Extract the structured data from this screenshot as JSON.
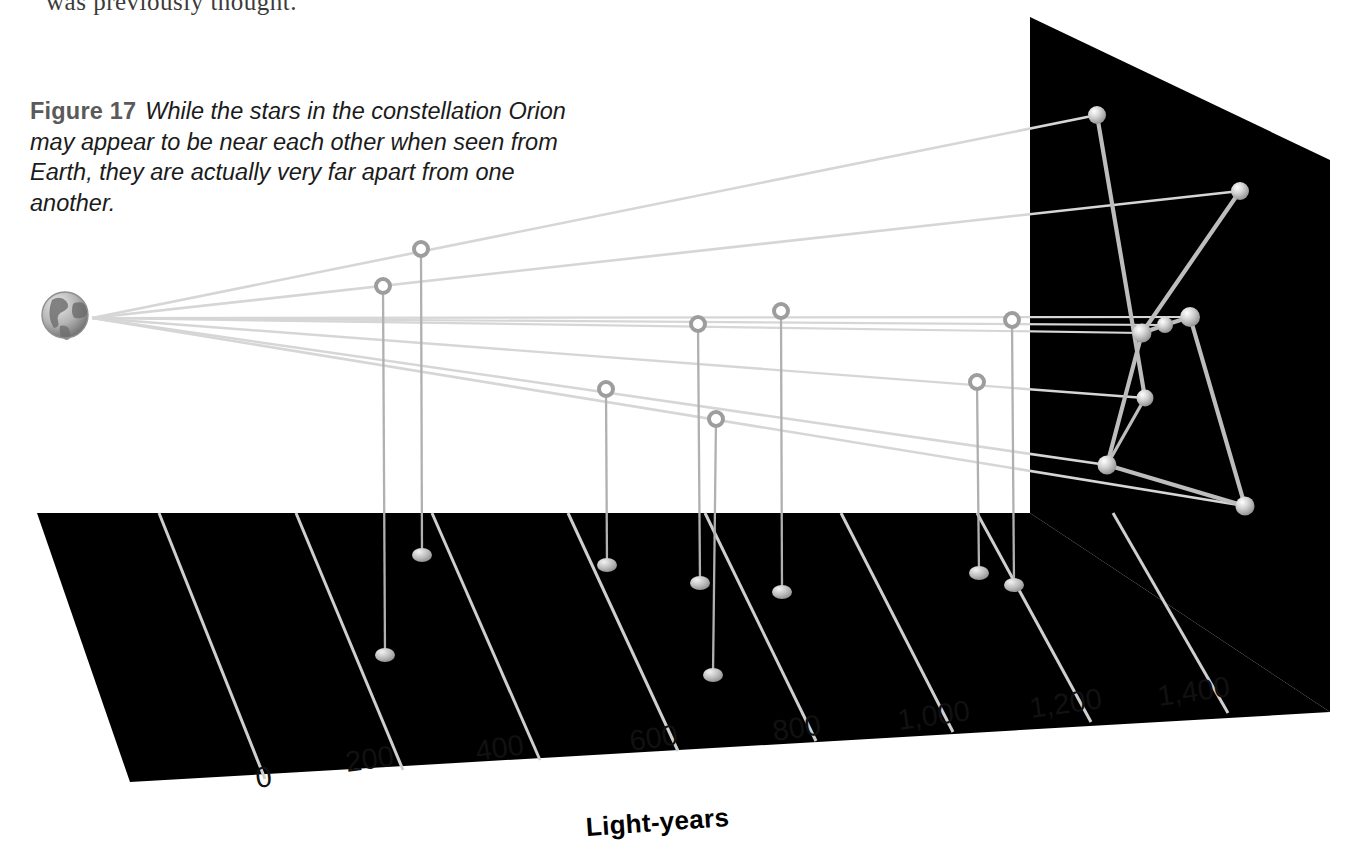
{
  "page": {
    "running_text_above": "was previously thought.",
    "background": "#ffffff"
  },
  "caption": {
    "figure_label": "Figure 17",
    "text": "While the stars in the constellation Orion may appear to be near each other when seen from Earth, they are actually very far apart from one another."
  },
  "figure": {
    "title": "Figure 17",
    "earth_label": "earth-globe",
    "panel_color": "#000000",
    "line_color": "#b9b9b9",
    "star_color": "#c9c9c9",
    "sightline_color": "#d9d9d9"
  },
  "chart_data": {
    "type": "scatter",
    "title": "While the stars in the constellation Orion may appear to be near each other when seen from Earth, they are actually very far apart from one another.",
    "xlabel": "Light-years",
    "ylabel": "",
    "xlim": [
      0,
      1500
    ],
    "grid": true,
    "legend": "none",
    "tick_labels": [
      "0",
      "200",
      "400",
      "600",
      "800",
      "1,000",
      "1,200",
      "1,400"
    ],
    "tick_values": [
      0,
      200,
      400,
      600,
      800,
      1000,
      1200,
      1400
    ],
    "axis_title": "Light-years",
    "note": "3-D perspective plot: each star of Orion is shown on a black back-plane (apparent sky position) and dropped with a vertical leader line to its true distance on the black ground plane scaled in light-years. Sight lines fan out from Earth at the left.",
    "observer": {
      "name": "Earth",
      "x_light_years": 0
    },
    "series": [
      {
        "name": "Orion stars",
        "points": [
          {
            "id": "star-1",
            "distance_light_years": 1240,
            "sky_x": 1097,
            "sky_y": 115,
            "ring_x": 421,
            "ring_y": 249,
            "ground_x": 422,
            "ground_y": 555
          },
          {
            "id": "star-2",
            "distance_light_years": 1380,
            "sky_x": 1240,
            "sky_y": 191,
            "ring_x": 383,
            "ring_y": 286,
            "ground_x": 385,
            "ground_y": 655
          },
          {
            "id": "star-3",
            "distance_light_years": 1320,
            "sky_x": 1145,
            "sky_y": 398,
            "ring_x": 977,
            "ring_y": 382,
            "ground_x": 979,
            "ground_y": 573
          },
          {
            "id": "star-4",
            "distance_light_years": 1360,
            "sky_x": 1107,
            "sky_y": 465,
            "ring_x": 606,
            "ring_y": 389,
            "ground_x": 607,
            "ground_y": 565
          },
          {
            "id": "star-5",
            "distance_light_years": 1430,
            "sky_x": 1245,
            "sky_y": 506,
            "ring_x": 716,
            "ring_y": 419,
            "ground_x": 713,
            "ground_y": 675
          },
          {
            "id": "star-6",
            "distance_light_years": 1360,
            "sky_x": 1142,
            "sky_y": 333,
            "ring_x": 698,
            "ring_y": 324,
            "ground_x": 700,
            "ground_y": 583
          },
          {
            "id": "star-7",
            "distance_light_years": 1340,
            "sky_x": 1165,
            "sky_y": 325,
            "ring_x": 781,
            "ring_y": 311,
            "ground_x": 782,
            "ground_y": 592
          },
          {
            "id": "star-8",
            "distance_light_years": 1360,
            "sky_x": 1190,
            "sky_y": 317,
            "ring_x": 1012,
            "ring_y": 320,
            "ground_x": 1014,
            "ground_y": 585
          }
        ]
      }
    ]
  },
  "axis": {
    "ticks": [
      {
        "label": "0",
        "x": 258,
        "y": 762
      },
      {
        "label": "200",
        "x": 348,
        "y": 746
      },
      {
        "label": "400",
        "x": 478,
        "y": 735
      },
      {
        "label": "600",
        "x": 632,
        "y": 725
      },
      {
        "label": "800",
        "x": 775,
        "y": 715
      },
      {
        "label": "1,000",
        "x": 900,
        "y": 704
      },
      {
        "label": "1,200",
        "x": 1032,
        "y": 692
      },
      {
        "label": "1,400",
        "x": 1160,
        "y": 680
      }
    ],
    "title": {
      "label": "Light-years",
      "x": 587,
      "y": 812
    }
  }
}
